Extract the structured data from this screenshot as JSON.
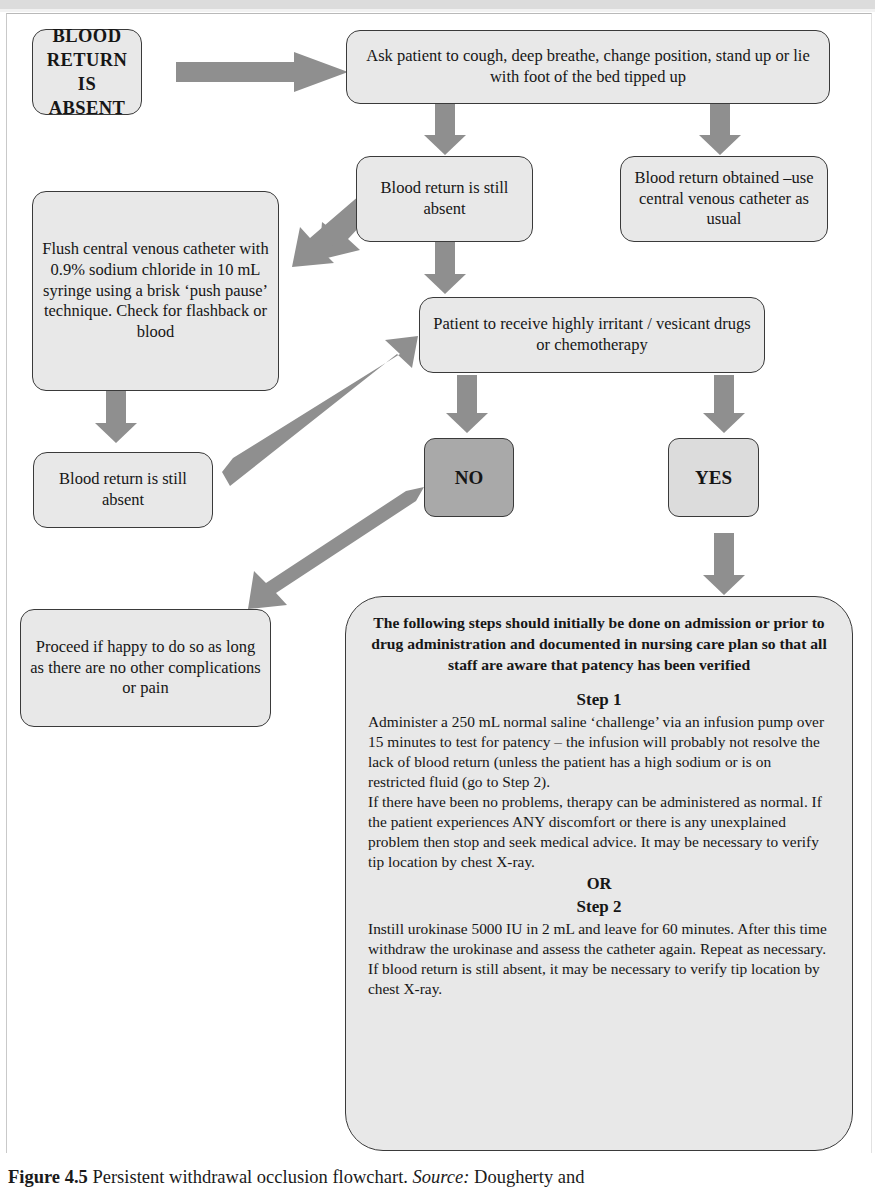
{
  "figure": {
    "caption_label": "Figure 4.5",
    "caption_text": " Persistent withdrawal occlusion flowchart. ",
    "caption_source_label": "Source:",
    "caption_source_text": " Dougherty and"
  },
  "colors": {
    "node_fill": "#e8e8e8",
    "node_border": "#3a3a3a",
    "arrow_fill": "#8f8f8f",
    "decision_no_fill": "#a9a9a9",
    "decision_yes_fill": "#dcdcdc",
    "page_background": "#ffffff"
  },
  "flowchart": {
    "title": "Persistent withdrawal occlusion flowchart",
    "nodes": [
      {
        "id": "start",
        "name": "blood-return-absent-node",
        "text": "BLOOD RETURN IS ABSENT",
        "style": "start"
      },
      {
        "id": "cough",
        "name": "ask-patient-to-cough-node",
        "text": "Ask patient to cough, deep breathe, change position, stand up or lie with foot of the bed tipped up",
        "style": "process"
      },
      {
        "id": "still-absent-1",
        "name": "blood-return-still-absent-node-1",
        "text": "Blood return is still absent",
        "style": "process"
      },
      {
        "id": "obtained",
        "name": "blood-return-obtained-node",
        "text": "Blood return obtained –use central venous catheter as usual",
        "style": "process"
      },
      {
        "id": "flush",
        "name": "flush-central-venous-catheter-node",
        "text": "Flush central venous catheter with 0.9% sodium chloride in 10 mL syringe using a brisk ‘push pause’ technique. Check for flashback or blood",
        "style": "process"
      },
      {
        "id": "still-absent-2",
        "name": "blood-return-still-absent-node-2",
        "text": "Blood return is still absent",
        "style": "process"
      },
      {
        "id": "irritant",
        "name": "patient-to-receive-irritant-drugs-node",
        "text": "Patient to receive highly irritant / vesicant drugs or chemotherapy",
        "style": "process"
      },
      {
        "id": "no",
        "name": "decision-no-node",
        "text": "NO",
        "style": "decision-no"
      },
      {
        "id": "yes",
        "name": "decision-yes-node",
        "text": "YES",
        "style": "decision-yes"
      },
      {
        "id": "proceed",
        "name": "proceed-if-happy-node",
        "text": "Proceed if happy to do so as long as there are no other complications or pain",
        "style": "process"
      }
    ],
    "steps_box": {
      "name": "steps-detail-node",
      "intro": "The following steps should initially be done on admission or prior to drug administration and documented in nursing care plan so that all staff are aware that patency has been verified",
      "step1_heading": "Step 1",
      "step1_paragraph_1": "Administer a 250 mL normal saline ‘challenge’ via an infusion pump over 15 minutes to test for patency – the infusion will probably not resolve the lack of blood return (unless the patient has a high sodium or is on restricted fluid (go to Step 2).",
      "step1_paragraph_2": "If there have been no problems, therapy can be administered as normal. If the patient experiences ANY discomfort or there is any unexplained problem then stop and seek medical advice. It may be necessary to verify tip location by chest X-ray.",
      "or_heading": "OR",
      "step2_heading": "Step 2",
      "step2_paragraph_1": "Instill urokinase 5000 IU in 2 mL and leave for 60 minutes. After this time withdraw the urokinase and assess the catheter again. Repeat as necessary. If blood return is still absent, it may be necessary to verify tip location by chest X-ray."
    },
    "connectors": [
      {
        "name": "arrow-start-to-cough",
        "direction": "right",
        "from": "start",
        "to": "cough"
      },
      {
        "name": "arrow-cough-to-still-absent-1",
        "direction": "down",
        "from": "cough",
        "to": "still-absent-1"
      },
      {
        "name": "arrow-cough-to-obtained",
        "direction": "down",
        "from": "cough",
        "to": "obtained"
      },
      {
        "name": "arrow-still-absent-1-to-flush",
        "direction": "down-left",
        "from": "still-absent-1",
        "to": "flush"
      },
      {
        "name": "arrow-still-absent-1-to-irritant",
        "direction": "down",
        "from": "still-absent-1",
        "to": "irritant"
      },
      {
        "name": "arrow-flush-to-still-absent-2",
        "direction": "down",
        "from": "flush",
        "to": "still-absent-2"
      },
      {
        "name": "arrow-still-absent-2-to-irritant",
        "direction": "up-right",
        "from": "still-absent-2",
        "to": "irritant"
      },
      {
        "name": "arrow-irritant-to-no",
        "direction": "down",
        "from": "irritant",
        "to": "no"
      },
      {
        "name": "arrow-irritant-to-yes",
        "direction": "down",
        "from": "irritant",
        "to": "yes"
      },
      {
        "name": "arrow-no-to-proceed",
        "direction": "down-left",
        "from": "no",
        "to": "proceed"
      },
      {
        "name": "arrow-yes-to-steps",
        "direction": "down",
        "from": "yes",
        "to": "steps_box"
      }
    ]
  }
}
